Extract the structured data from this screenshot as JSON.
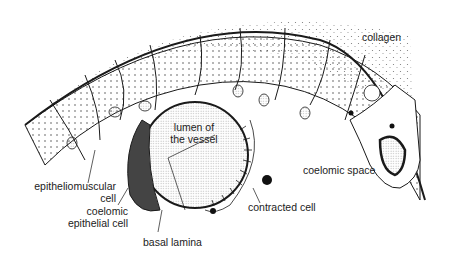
{
  "figure": {
    "type": "cross-section illustration",
    "colors": {
      "ink": "#1a1a1a",
      "background": "#ffffff",
      "stipple": "#555555"
    }
  },
  "labels": {
    "collagen": "collagen",
    "lumen_line1": "lumen of",
    "lumen_line2": "the vessel",
    "epitheliomuscular_line1": "epitheliomuscular",
    "epitheliomuscular_line2": "cell",
    "coelomic_epithelial_line1": "coelomic",
    "coelomic_epithelial_line2": "epithelial cell",
    "coelomic_space": "coelomic space",
    "contracted_cell": "contracted cell",
    "basal_lamina": "basal lamina"
  }
}
